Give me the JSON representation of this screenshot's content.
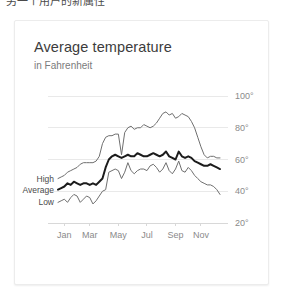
{
  "top_strip": {
    "cropped_text": "另一个用户的新属性"
  },
  "card": {
    "title": "Average temperature",
    "subtitle": "in Fahrenheit"
  },
  "series_labels": {
    "high": "High",
    "average": "Average",
    "low": "Low"
  },
  "colors": {
    "average_line": "#1c1c1c",
    "high_line": "#6f6f6f",
    "low_line": "#6f6f6f",
    "gridline": "#e9e9e9",
    "card_background": "#ffffff",
    "title_text": "#3c3c3c",
    "subtitle_text": "#7b7b7b",
    "axis_text": "#8a8a8a"
  },
  "chart_data": {
    "type": "line",
    "title": "Average temperature",
    "subtitle": "in Fahrenheit",
    "xlabel": "",
    "ylabel": "",
    "ylim": [
      20,
      100
    ],
    "yticks": [
      20,
      40,
      60,
      80,
      100
    ],
    "ytick_labels": [
      "20°",
      "40°",
      "60°",
      "80°",
      "100°"
    ],
    "grid": true,
    "legend_position": "inline-left",
    "xtick_labels": [
      "Jan",
      "Mar",
      "May",
      "Jul",
      "Sep",
      "Nov"
    ],
    "xtick_indices": [
      2,
      10,
      19,
      28,
      37,
      45
    ],
    "x_count": 52,
    "x_unit": "week",
    "series": [
      {
        "name": "High",
        "values": [
          48,
          49,
          50,
          52,
          53,
          54,
          55,
          57,
          58,
          58,
          58,
          58,
          59,
          62,
          70,
          74,
          75,
          75,
          76,
          76,
          63,
          77,
          80,
          81,
          79,
          80,
          80,
          82,
          81,
          80,
          81,
          83,
          86,
          89,
          90,
          88,
          89,
          86,
          87,
          89,
          88,
          87,
          84,
          80,
          74,
          68,
          63,
          61,
          62,
          62,
          61,
          61
        ]
      },
      {
        "name": "Average",
        "values": [
          41,
          42,
          43,
          45,
          44,
          46,
          45,
          44,
          45,
          45,
          44,
          45,
          44,
          46,
          48,
          55,
          60,
          62,
          63,
          62,
          61,
          62,
          63,
          62,
          62,
          64,
          63,
          62,
          62,
          63,
          64,
          63,
          62,
          63,
          65,
          62,
          61,
          60,
          65,
          62,
          61,
          62,
          61,
          59,
          58,
          57,
          56,
          56,
          57,
          56,
          55,
          54
        ]
      },
      {
        "name": "Low",
        "values": [
          33,
          34,
          35,
          33,
          36,
          38,
          37,
          33,
          35,
          37,
          36,
          32,
          34,
          37,
          40,
          41,
          52,
          53,
          54,
          53,
          48,
          52,
          58,
          53,
          51,
          53,
          54,
          54,
          53,
          56,
          57,
          55,
          52,
          54,
          58,
          53,
          51,
          54,
          59,
          53,
          52,
          55,
          53,
          50,
          48,
          46,
          45,
          44,
          44,
          43,
          41,
          38
        ]
      }
    ]
  }
}
